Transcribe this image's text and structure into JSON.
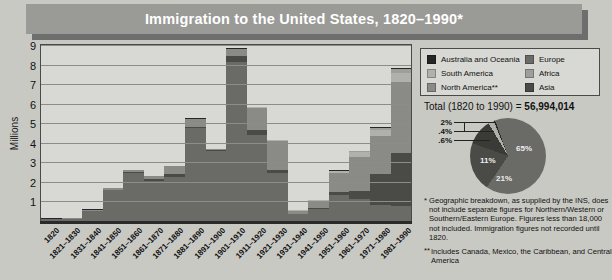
{
  "title": "Immigration to the United States, 1820–1990*",
  "axis": {
    "ylabel": "Millions",
    "yticks": [
      "9",
      "8",
      "7",
      "6",
      "5",
      "4",
      "3",
      "2",
      "1"
    ]
  },
  "legend": {
    "left": [
      {
        "label": "Australia and Oceania",
        "color": "#262626"
      },
      {
        "label": "South America",
        "color": "#b0b0ac"
      },
      {
        "label": "North America**",
        "color": "#8a8a86"
      }
    ],
    "right": [
      {
        "label": "Europe",
        "color": "#6a6a66"
      },
      {
        "label": "Africa",
        "color": "#9e9e9a"
      },
      {
        "label": "Asia",
        "color": "#4a4a46"
      }
    ]
  },
  "total": {
    "prefix": "Total (1820 to 1990) = ",
    "value": "56,994,014"
  },
  "footnotes": {
    "star": "*",
    "note1": "Geographic breakdown, as supplied by the INS, does not include separate figures for Northern/Western or Southern/Eastern Europe. Figures less than 18,000 not included. Immigration figures not recorded until 1820.",
    "doublestar": "**",
    "note2": "Includes Canada, Mexico, the Caribbean, and Central America"
  },
  "chart_data": {
    "type": "bar",
    "title": "Immigration to the United States, 1820–1990*",
    "xlabel": "",
    "ylabel": "Millions",
    "ylim": [
      0,
      9
    ],
    "grid": true,
    "stacked": true,
    "categories": [
      "1820",
      "1821–1830",
      "1831–1840",
      "1841–1850",
      "1851–1860",
      "1861–1870",
      "1871–1880",
      "1881–1890",
      "1891–1900",
      "1901–1910",
      "1911–1920",
      "1921–1930",
      "1931–1940",
      "1941–1950",
      "1951–1960",
      "1961–1970",
      "1971–1980",
      "1981–1990"
    ],
    "totals": [
      0.13,
      0.14,
      0.6,
      1.71,
      2.6,
      2.31,
      2.81,
      5.25,
      3.69,
      8.8,
      5.74,
      4.11,
      0.53,
      1.04,
      2.52,
      3.32,
      4.49,
      7.34
    ],
    "series": [
      {
        "name": "Europe",
        "color": "#6a6a66",
        "values": [
          0.1,
          0.11,
          0.5,
          1.6,
          2.45,
          2.06,
          2.27,
          4.74,
          3.56,
          8.14,
          4.38,
          2.48,
          0.35,
          0.62,
          1.33,
          1.12,
          0.8,
          0.76
        ]
      },
      {
        "name": "Asia",
        "color": "#4a4a46",
        "values": [
          0.0,
          0.0,
          0.0,
          0.0,
          0.04,
          0.07,
          0.13,
          0.07,
          0.08,
          0.32,
          0.25,
          0.11,
          0.02,
          0.04,
          0.15,
          0.43,
          1.59,
          2.74
        ]
      },
      {
        "name": "North America**",
        "color": "#8a8a86",
        "values": [
          0.01,
          0.02,
          0.06,
          0.1,
          0.1,
          0.17,
          0.4,
          0.43,
          0.04,
          0.36,
          1.14,
          1.52,
          0.16,
          0.38,
          1.0,
          1.72,
          1.98,
          3.62
        ]
      },
      {
        "name": "South America",
        "color": "#b0b0ac",
        "values": [
          0.0,
          0.0,
          0.0,
          0.0,
          0.0,
          0.0,
          0.0,
          0.0,
          0.0,
          0.0,
          0.04,
          0.04,
          0.01,
          0.02,
          0.08,
          0.26,
          0.3,
          0.46
        ]
      },
      {
        "name": "Africa",
        "color": "#9e9e9a",
        "values": [
          0.0,
          0.0,
          0.0,
          0.0,
          0.0,
          0.0,
          0.0,
          0.0,
          0.0,
          0.0,
          0.01,
          0.01,
          0.0,
          0.01,
          0.02,
          0.03,
          0.08,
          0.18
        ]
      },
      {
        "name": "Australia and Oceania",
        "color": "#262626",
        "values": [
          0.02,
          0.01,
          0.04,
          0.01,
          0.01,
          0.01,
          0.01,
          0.01,
          0.01,
          0.02,
          0.02,
          0.01,
          0.01,
          0.01,
          0.01,
          0.02,
          0.04,
          0.05
        ]
      }
    ]
  },
  "pie_data": {
    "type": "pie",
    "title": "Total (1820 to 1990) = 56,994,014",
    "labels": [
      "65%",
      "21%",
      "11%",
      "2%",
      ".4%",
      ".6%"
    ],
    "values": [
      65,
      21,
      11,
      2,
      0.4,
      0.6
    ],
    "slice_names": [
      "Europe",
      "North America**",
      "Asia",
      "South America",
      "Africa",
      "Australia and Oceania"
    ],
    "colors": [
      "#6a6a66",
      "#4a4a46",
      "#3a3a36",
      "#b0b0ac",
      "#9e9e9a",
      "#262626"
    ],
    "inside_labels": [
      "65%",
      "21%",
      "11%"
    ],
    "outside_labels": [
      "2%",
      ".4%",
      ".6%"
    ]
  }
}
